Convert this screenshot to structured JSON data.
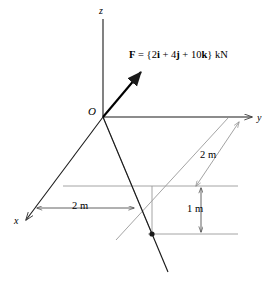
{
  "figure": {
    "type": "engineering-statics-3d-force-diagram",
    "axes": {
      "x_label": "x",
      "y_label": "y",
      "z_label": "z",
      "origin_label": "O"
    },
    "force": {
      "label_prefix": "F",
      "label_equals": " = {2",
      "label_i": "i",
      "label_plus1": " + 4",
      "label_j": "j",
      "label_plus2": " + 10",
      "label_k": "k",
      "label_suffix": "} kN",
      "full_text": "F = {2i + 4j + 10k} kN",
      "components": {
        "i": 2,
        "j": 4,
        "k": 10,
        "unit": "kN"
      }
    },
    "dimensions": [
      {
        "name": "x-distance",
        "text": "2 m",
        "value": 2,
        "unit": "m"
      },
      {
        "name": "y-distance",
        "text": "2 m",
        "value": 2,
        "unit": "m"
      },
      {
        "name": "z-drop",
        "text": "1 m",
        "value": 1,
        "unit": "m"
      }
    ],
    "colors": {
      "stroke_dark": "#1a1a1a",
      "stroke_light": "#9a9a9a",
      "background": "#ffffff"
    }
  }
}
